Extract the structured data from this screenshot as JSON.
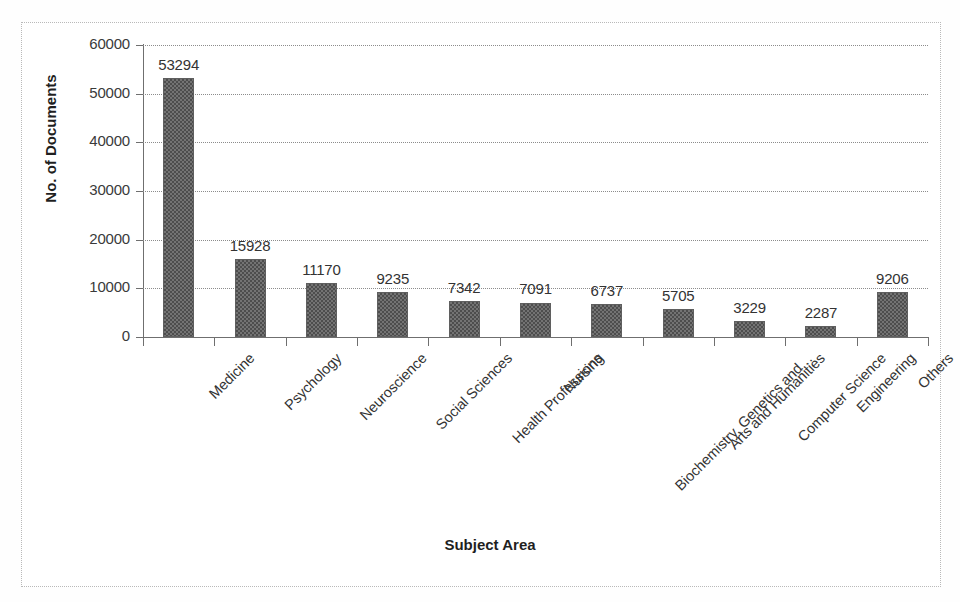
{
  "chart_data": {
    "type": "bar",
    "title": "",
    "subtitle": "",
    "xlabel": "Subject Area",
    "ylabel": "No. of Documents",
    "categories": [
      "Medicine",
      "Psychology",
      "Neuroscience",
      "Social Sciences",
      "Health Professions",
      "Nursing",
      "Biochemistry, Genetics and…",
      "Arts and Humanities",
      "Computer Science",
      "Engineering",
      "Others"
    ],
    "values": [
      53294,
      15928,
      11170,
      9235,
      7342,
      7091,
      6737,
      5705,
      3229,
      2287,
      9206
    ],
    "data_labels": [
      "53294",
      "15928",
      "11170",
      "9235",
      "7342",
      "7091",
      "6737",
      "5705",
      "3229",
      "2287",
      "9206"
    ],
    "ylim": [
      0,
      60000
    ],
    "ytick_values": [
      0,
      10000,
      20000,
      30000,
      40000,
      50000,
      60000
    ],
    "ytick_labels": [
      "0",
      "10000",
      "20000",
      "30000",
      "40000",
      "50000",
      "60000"
    ],
    "grid": true,
    "grid_axis": "y",
    "legend": false,
    "legend_position": "none",
    "bar_color": "#737373",
    "bar_pattern": "checkerboard-dither",
    "bar_edge_color": "#5f5f5f",
    "gridline_color": "#8c8c8c",
    "axis_color": "#6f6f6f",
    "text_color": "#333333",
    "background_color": "#ffffff",
    "border_color": "#b9b9b9",
    "xtick_label_rotation": -45
  }
}
